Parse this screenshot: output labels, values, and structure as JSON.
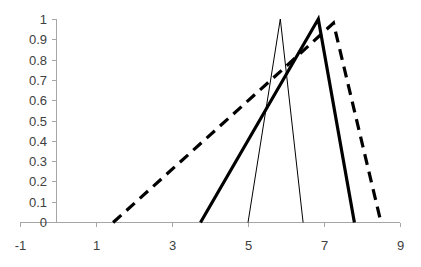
{
  "chart_data": {
    "type": "line",
    "title": "",
    "subtitle": "",
    "xlabel": "",
    "ylabel": "",
    "xlim": [
      -1,
      9
    ],
    "ylim": [
      0,
      1
    ],
    "xticks": [
      -1,
      1,
      3,
      5,
      7,
      9
    ],
    "xtick_labels": [
      "-1",
      "1",
      "3",
      "5",
      "7",
      "9"
    ],
    "yticks": [
      0,
      0.1,
      0.2,
      0.3,
      0.4,
      0.5,
      0.6,
      0.7,
      0.8,
      0.9,
      1
    ],
    "ytick_labels": [
      "0",
      "0.1",
      "0.2",
      "0.3",
      "0.4",
      "0.5",
      "0.6",
      "0.7",
      "0.8",
      "0.9",
      "1"
    ],
    "grid": false,
    "legend": null,
    "legend_position": "none",
    "annotations": [],
    "series": [
      {
        "name": "thin-solid-triangle",
        "style": "solid",
        "stroke_width": 1,
        "color": "#000000",
        "x": [
          5.0,
          5.85,
          6.45
        ],
        "y": [
          0,
          1,
          0
        ]
      },
      {
        "name": "thick-solid-triangle",
        "style": "solid",
        "stroke_width": 3.2,
        "color": "#000000",
        "x": [
          3.75,
          6.85,
          7.8
        ],
        "y": [
          0,
          1,
          0
        ]
      },
      {
        "name": "dashed-triangle",
        "style": "dashed",
        "stroke_width": 3.2,
        "color": "#000000",
        "x": [
          1.45,
          5.9,
          7.25,
          8.5
        ],
        "y": [
          0,
          0.75,
          0.98,
          0
        ]
      }
    ]
  },
  "axes": {
    "x_axis_name": "x-axis",
    "y_axis_name": "y-axis",
    "axis_color": "#a6a6a6",
    "tick_text_color": "#404040"
  }
}
